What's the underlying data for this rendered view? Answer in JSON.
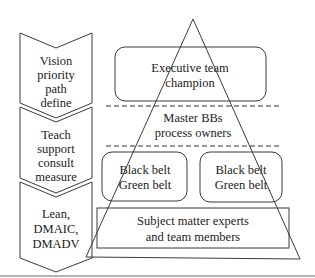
{
  "diagram": {
    "type": "six-sigma-organization-pyramid",
    "left_column": {
      "chevrons": [
        {
          "lines": [
            "Vision",
            "priority",
            "path",
            "define"
          ]
        },
        {
          "lines": [
            "Teach",
            "support",
            "consult",
            "measure"
          ]
        },
        {
          "lines": [
            "Lean,",
            "DMAIC,",
            "DMADV"
          ]
        }
      ]
    },
    "pyramid": {
      "tiers": [
        {
          "name": "executive",
          "lines": [
            "Executive team",
            "champion"
          ]
        },
        {
          "name": "master",
          "lines": [
            "Master BBs",
            "process owners"
          ]
        },
        {
          "name": "belt-left",
          "lines": [
            "Black belt",
            "Green belt"
          ]
        },
        {
          "name": "belt-right",
          "lines": [
            "Black belt",
            "Green belt"
          ]
        },
        {
          "name": "sme",
          "lines": [
            "Subject matter experts",
            "and team members"
          ]
        }
      ]
    },
    "colors": {
      "line": "#3a3a3a",
      "text": "#222222",
      "background": "#ffffff"
    }
  }
}
